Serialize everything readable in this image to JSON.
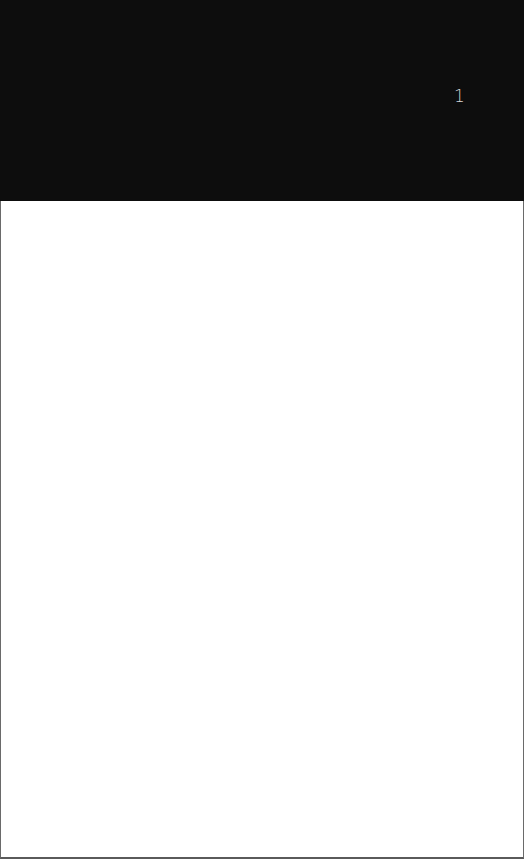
{
  "header": {
    "background_color": "#0d0d0d",
    "page_number": "1"
  },
  "content": {
    "background_color": "#ffffff",
    "text": ""
  }
}
